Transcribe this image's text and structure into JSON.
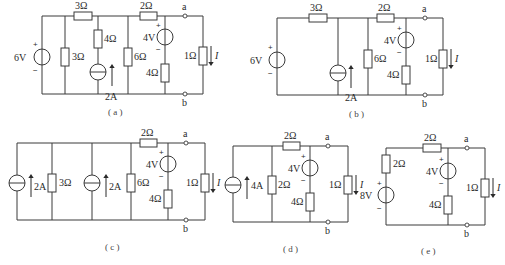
{
  "figure": {
    "colors": {
      "line": "#3a3a3a",
      "text": "#2a2a2a",
      "background": "#ffffff"
    }
  },
  "circuits": {
    "a": {
      "caption": "( a )",
      "voltage_source": {
        "value": "6V",
        "plus": "+",
        "minus": "−"
      },
      "r_parallel": "3Ω",
      "r_series_top": "3Ω",
      "r_branch": "4Ω",
      "current_source": "2A",
      "r_shunt": "6Ω",
      "r_top2": "2Ω",
      "v_branch": {
        "value": "4V",
        "plus": "+",
        "minus": "−"
      },
      "r_v_branch": "4Ω",
      "r_load": "1Ω",
      "current_label": "I",
      "terminal_a": "a",
      "terminal_b": "b"
    },
    "b": {
      "caption": "( b )",
      "voltage_source": {
        "value": "6V",
        "plus": "+",
        "minus": "−"
      },
      "r_series_top": "3Ω",
      "current_source": "2A",
      "r_shunt": "6Ω",
      "r_top2": "2Ω",
      "v_branch": {
        "value": "4V",
        "plus": "+",
        "minus": "−"
      },
      "r_v_branch": "4Ω",
      "r_load": "1Ω",
      "current_label": "I",
      "terminal_a": "a",
      "terminal_b": "b"
    },
    "c": {
      "caption": "( c )",
      "current_source_1": "2A",
      "r_parallel": "3Ω",
      "current_source_2": "2A",
      "r_shunt": "6Ω",
      "r_top2": "2Ω",
      "v_branch": {
        "value": "4V",
        "plus": "+",
        "minus": "−"
      },
      "r_v_branch": "4Ω",
      "r_load": "1Ω",
      "current_label": "I",
      "terminal_a": "a",
      "terminal_b": "b"
    },
    "d": {
      "caption": "( d )",
      "current_source": "4A",
      "r_shunt": "2Ω",
      "r_top2": "2Ω",
      "v_branch": {
        "value": "4V",
        "plus": "+",
        "minus": "−"
      },
      "r_v_branch": "4Ω",
      "r_load": "1Ω",
      "current_label": "I",
      "terminal_a": "a",
      "terminal_b": "b"
    },
    "e": {
      "caption": "( e )",
      "r_series_left": "2Ω",
      "voltage_source": {
        "value": "8V",
        "plus": "+",
        "minus": "−"
      },
      "r_top2": "2Ω",
      "v_branch": {
        "value": "4V",
        "plus": "+",
        "minus": "−"
      },
      "r_v_branch": "4Ω",
      "r_load": "1Ω",
      "current_label": "I",
      "terminal_a": "a",
      "terminal_b": "b"
    }
  }
}
